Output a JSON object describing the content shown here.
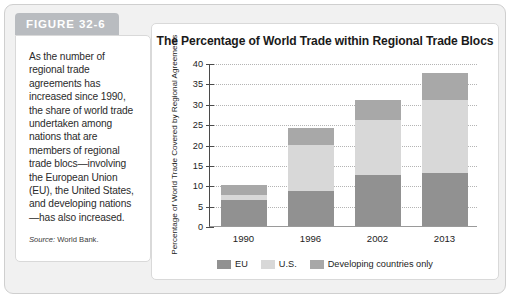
{
  "figure": {
    "badge_label": "FIGURE 32-6",
    "caption": "As the number of regional trade agreements has increased since 1990, the share of world trade undertaken among nations that are members of regional trade blocs—involving the European Union (EU), the United States, and developing nations—has also increased.",
    "source_label": "Source:",
    "source_value": "World Bank."
  },
  "chart_data": {
    "type": "bar",
    "subtype": "stacked-bar",
    "title": "The Percentage of World Trade within Regional Trade Blocs",
    "xlabel": "",
    "ylabel": "Percentage of World Trade Covered by Regional Agreements",
    "ylim": [
      0,
      40
    ],
    "ytick_step": 5,
    "yticks": [
      0,
      5,
      10,
      15,
      20,
      25,
      30,
      35,
      40
    ],
    "grid": true,
    "grid_style": "dotted-horizontal",
    "legend_position": "bottom-center",
    "categories": [
      "1990",
      "1996",
      "2002",
      "2013"
    ],
    "series": [
      {
        "name": "EU",
        "color": "#919191",
        "values": [
          6.5,
          8.5,
          12.5,
          13.0
        ]
      },
      {
        "name": "U.S.",
        "color": "#d8d8d8",
        "values": [
          1.0,
          11.5,
          13.5,
          18.0
        ]
      },
      {
        "name": "Developing countries only",
        "color": "#a8a8a8",
        "values": [
          2.5,
          4.0,
          5.0,
          6.5
        ]
      }
    ],
    "totals": [
      10.0,
      24.0,
      31.0,
      37.5
    ],
    "annotations": []
  },
  "colors": {
    "badge": "#b9bcc0",
    "card_background": "#f1f1f1",
    "panel_background": "#ffffff",
    "axis": "#4a4a4a",
    "gridline": "#b4b4b4"
  }
}
